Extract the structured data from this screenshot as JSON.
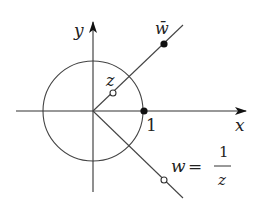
{
  "diagram": {
    "title": "",
    "axes": {
      "x_label": "x",
      "y_label": "y"
    },
    "unit_circle": {
      "label": "1"
    },
    "points": {
      "z": {
        "label": "z",
        "style": "open"
      },
      "w_bar": {
        "label": "w̄",
        "style": "filled"
      },
      "w": {
        "label": "w",
        "style": "open"
      },
      "one": {
        "label": "1",
        "style": "filled"
      }
    },
    "equation": {
      "lhs": "w",
      "eq": "=",
      "numerator": "1",
      "denominator": "z"
    },
    "colors": {
      "stroke": "#333333",
      "fill": "#111111",
      "background": "#ffffff"
    }
  }
}
